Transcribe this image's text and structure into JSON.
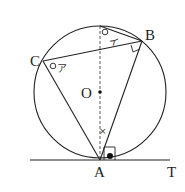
{
  "diagram": {
    "points": {
      "A": {
        "label": "A"
      },
      "B": {
        "label": "B"
      },
      "C": {
        "label": "C"
      },
      "O": {
        "label": "O"
      },
      "T": {
        "label": "T"
      }
    },
    "angle_labels": {
      "a": "ア",
      "i": "イ",
      "x": "×"
    },
    "colors": {
      "line": "#222222",
      "background": "#ffffff"
    }
  }
}
